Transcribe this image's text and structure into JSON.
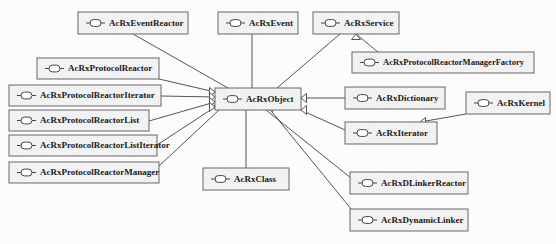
{
  "diagram": {
    "type": "uml-class-inheritance",
    "icon_name": "uml-interface-lollipop-icon",
    "relation_name": "generalization-arrow",
    "colors": {
      "background": "#fcfcfc",
      "box_fill": "#f2f2f2",
      "box_stroke": "#666666",
      "edge_stroke": "#555555",
      "text": "#1a1a1a"
    },
    "root": "AcRxObject",
    "nodes": [
      {
        "id": "acrxeventreactor",
        "label": "AcRxEventReactor",
        "x": 78,
        "y": 12,
        "w": 110,
        "h": 22,
        "fs": 9
      },
      {
        "id": "acrxevent",
        "label": "AcRxEvent",
        "x": 218,
        "y": 12,
        "w": 80,
        "h": 22,
        "fs": 9
      },
      {
        "id": "acrxservice",
        "label": "AcRxService",
        "x": 313,
        "y": 12,
        "w": 86,
        "h": 22,
        "fs": 9
      },
      {
        "id": "acrxprotocolreactormanagerfactory",
        "label": "AcRxProtocolReactorManagerFactory",
        "x": 352,
        "y": 52,
        "w": 182,
        "h": 21,
        "fs": 8.5
      },
      {
        "id": "acrxprotocolreactor",
        "label": "AcRxProtocolReactor",
        "x": 37,
        "y": 58,
        "w": 122,
        "h": 21,
        "fs": 9
      },
      {
        "id": "acrxprotocolreactoriterator",
        "label": "AcRxProtocolReactorIterator",
        "x": 9,
        "y": 85,
        "w": 152,
        "h": 21,
        "fs": 9
      },
      {
        "id": "acrxobject",
        "label": "AcRxObject",
        "x": 215,
        "y": 88,
        "w": 86,
        "h": 22,
        "fs": 9
      },
      {
        "id": "acrxdictionary",
        "label": "AcRxDictionary",
        "x": 345,
        "y": 87,
        "w": 100,
        "h": 22,
        "fs": 9
      },
      {
        "id": "acrxkernel",
        "label": "AcRxKernel",
        "x": 466,
        "y": 92,
        "w": 84,
        "h": 22,
        "fs": 9
      },
      {
        "id": "acrxprotocolreactorlist",
        "label": "AcRxProtocolReactorList",
        "x": 9,
        "y": 110,
        "w": 140,
        "h": 21,
        "fs": 9
      },
      {
        "id": "acrxiterator",
        "label": "AcRxIterator",
        "x": 345,
        "y": 122,
        "w": 92,
        "h": 22,
        "fs": 9
      },
      {
        "id": "acrxprotocolreactorlistiterator",
        "label": "AcRxProtocolReactorListIterator",
        "x": 9,
        "y": 135,
        "w": 148,
        "h": 21,
        "fs": 9
      },
      {
        "id": "acrxprotocolreactormanager",
        "label": "AcRxProtocolReactorManager",
        "x": 9,
        "y": 162,
        "w": 150,
        "h": 21,
        "fs": 9
      },
      {
        "id": "acrxclass",
        "label": "AcRxClass",
        "x": 203,
        "y": 168,
        "w": 86,
        "h": 22,
        "fs": 9
      },
      {
        "id": "acrxdlinkerreactor",
        "label": "AcRxDLinkerReactor",
        "x": 350,
        "y": 172,
        "w": 118,
        "h": 22,
        "fs": 9
      },
      {
        "id": "acrxdynamiclinker",
        "label": "AcRxDynamicLinker",
        "x": 350,
        "y": 209,
        "w": 118,
        "h": 22,
        "fs": 9
      }
    ],
    "edges": [
      {
        "from": "acrxeventreactor",
        "to": "acrxobject",
        "x1": 133,
        "y1": 34,
        "x2": 228,
        "y2": 88,
        "head": "up"
      },
      {
        "from": "acrxevent",
        "to": "acrxobject",
        "x1": 252,
        "y1": 34,
        "x2": 252,
        "y2": 88,
        "head": "up"
      },
      {
        "from": "acrxservice",
        "to": "acrxobject",
        "x1": 340,
        "y1": 34,
        "x2": 277,
        "y2": 88,
        "head": "up"
      },
      {
        "from": "acrxprotocolreactormanagerfactory",
        "to": "acrxservice",
        "x1": 378,
        "y1": 52,
        "x2": 356,
        "y2": 34,
        "head": "up"
      },
      {
        "from": "acrxprotocolreactor",
        "to": "acrxobject",
        "x1": 159,
        "y1": 79,
        "x2": 215,
        "y2": 92,
        "head": "right"
      },
      {
        "from": "acrxprotocolreactoriterator",
        "to": "acrxobject",
        "x1": 161,
        "y1": 96,
        "x2": 215,
        "y2": 97,
        "head": "right"
      },
      {
        "from": "acrxprotocolreactorlist",
        "to": "acrxobject",
        "x1": 149,
        "y1": 121,
        "x2": 215,
        "y2": 102,
        "head": "right"
      },
      {
        "from": "acrxprotocolreactorlistiterator",
        "to": "acrxobject",
        "x1": 157,
        "y1": 145,
        "x2": 215,
        "y2": 107,
        "head": "right"
      },
      {
        "from": "acrxprotocolreactormanager",
        "to": "acrxobject",
        "x1": 159,
        "y1": 166,
        "x2": 219,
        "y2": 110,
        "head": "downleft"
      },
      {
        "from": "acrxdictionary",
        "to": "acrxobject",
        "x1": 345,
        "y1": 98,
        "x2": 301,
        "y2": 98,
        "head": "left"
      },
      {
        "from": "acrxiterator",
        "to": "acrxobject",
        "x1": 345,
        "y1": 130,
        "x2": 301,
        "y2": 110,
        "head": "left"
      },
      {
        "from": "acrxkernel",
        "to": "acrxiterator",
        "x1": 466,
        "y1": 114,
        "x2": 420,
        "y2": 122,
        "head": "upright"
      },
      {
        "from": "acrxclass",
        "to": "acrxobject",
        "x1": 246,
        "y1": 168,
        "x2": 246,
        "y2": 110,
        "head": "down"
      },
      {
        "from": "acrxdlinkerreactor",
        "to": "acrxobject",
        "x1": 356,
        "y1": 182,
        "x2": 266,
        "y2": 110,
        "head": "down"
      },
      {
        "from": "acrxdynamiclinker",
        "to": "acrxobject",
        "x1": 356,
        "y1": 215,
        "x2": 272,
        "y2": 112,
        "head": "down"
      }
    ]
  }
}
